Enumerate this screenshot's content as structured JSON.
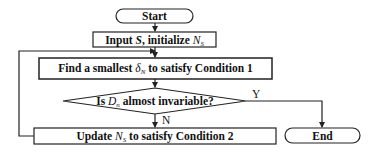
{
  "diagram": {
    "type": "flowchart",
    "nodes": {
      "start": {
        "label": "Start",
        "shape": "terminal"
      },
      "input": {
        "prefix": "Input ",
        "var": "S",
        "suffix": ", initialize ",
        "var2": "N",
        "var2_sub": "S",
        "shape": "process"
      },
      "find": {
        "prefix": "Find a smallest ",
        "var": "δ",
        "var_sub": "N",
        "suffix": " to satisfy Condition 1",
        "shape": "process"
      },
      "decision": {
        "prefix": "Is ",
        "var": "D",
        "var_sub": "n",
        "suffix": " almost invariable?",
        "shape": "decision"
      },
      "update": {
        "prefix": "Update ",
        "var": "N",
        "var_sub": "S",
        "suffix": " to satisfy Condition 2",
        "shape": "process"
      },
      "end": {
        "label": "End",
        "shape": "terminal"
      }
    },
    "edges": [
      {
        "from": "start",
        "to": "input",
        "label": ""
      },
      {
        "from": "input",
        "to": "find",
        "label": ""
      },
      {
        "from": "find",
        "to": "decision",
        "label": ""
      },
      {
        "from": "decision",
        "to": "end",
        "label": "Y"
      },
      {
        "from": "decision",
        "to": "update",
        "label": "N"
      },
      {
        "from": "update",
        "to": "find",
        "label": ""
      }
    ],
    "edge_labels": {
      "yes": "Y",
      "no": "N"
    },
    "colors": {
      "stroke": "#222222",
      "background": "#ffffff",
      "text": "#111111"
    }
  }
}
